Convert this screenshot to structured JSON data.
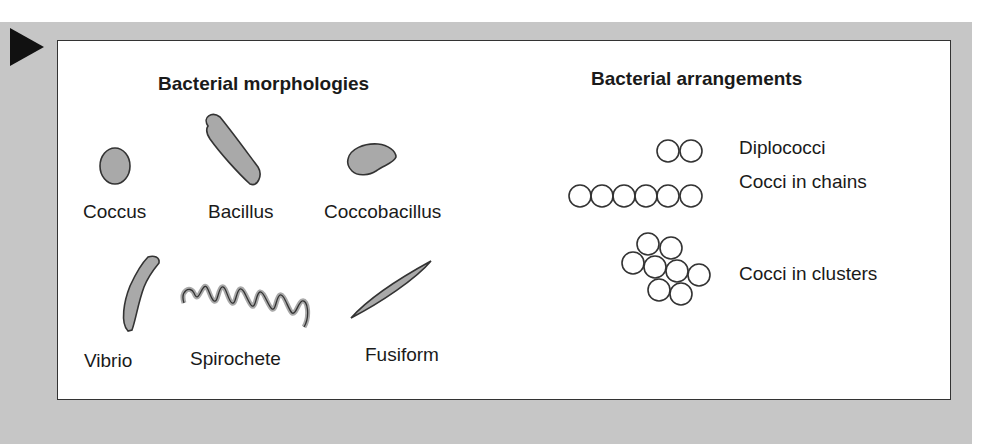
{
  "figure": {
    "marker_icon": "play-triangle-icon",
    "colors": {
      "panel_background": "#c6c6c6",
      "box_background": "#ffffff",
      "shape_fill": "#a9a9a9",
      "outline": "#333333",
      "text": "#1a1a1a"
    },
    "morphologies": {
      "title": "Bacterial morphologies",
      "items": [
        {
          "label": "Coccus",
          "shape": "coccus-shape"
        },
        {
          "label": "Bacillus",
          "shape": "bacillus-shape"
        },
        {
          "label": "Coccobacillus",
          "shape": "coccobacillus-shape"
        },
        {
          "label": "Vibrio",
          "shape": "vibrio-shape"
        },
        {
          "label": "Spirochete",
          "shape": "spirochete-shape"
        },
        {
          "label": "Fusiform",
          "shape": "fusiform-shape"
        }
      ]
    },
    "arrangements": {
      "title": "Bacterial arrangements",
      "items": [
        {
          "label": "Diplococci",
          "circle_count": 2
        },
        {
          "label": "Cocci in chains",
          "circle_count": 6
        },
        {
          "label": "Cocci in clusters",
          "circle_count": 8
        }
      ]
    }
  }
}
